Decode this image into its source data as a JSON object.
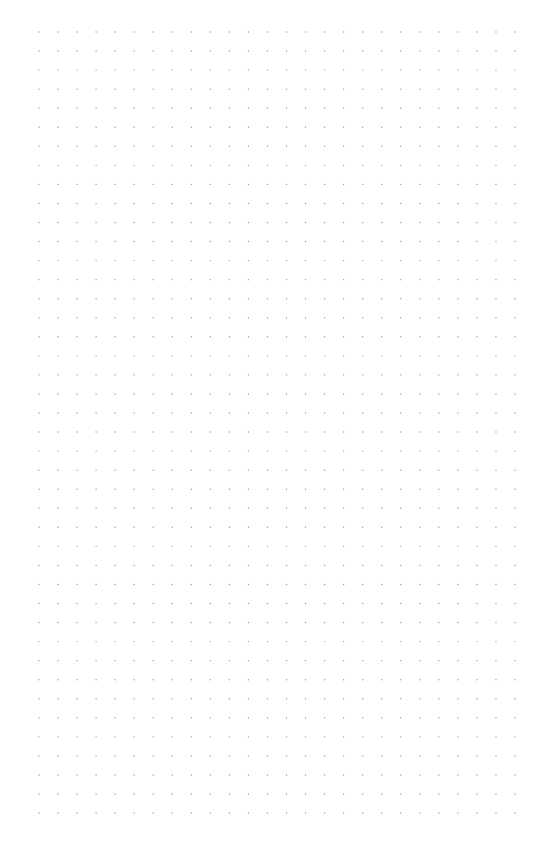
{
  "page": {
    "type": "dot-grid",
    "background_color": "#ffffff",
    "dot_color": "#9a9a9a",
    "dot_radius": 0.7,
    "grid": {
      "columns": 26,
      "rows": 42,
      "origin_x": 39,
      "origin_y": 32,
      "spacing_x": 19.04,
      "spacing_y": 19.05
    }
  }
}
